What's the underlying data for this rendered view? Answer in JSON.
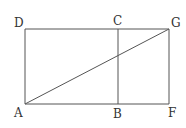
{
  "diagram": {
    "type": "geometry-figure",
    "points": {
      "A": {
        "label": "A",
        "x": 25,
        "y": 104
      },
      "B": {
        "label": "B",
        "x": 118,
        "y": 104
      },
      "F": {
        "label": "F",
        "x": 169,
        "y": 104
      },
      "D": {
        "label": "D",
        "x": 25,
        "y": 29
      },
      "C": {
        "label": "C",
        "x": 118,
        "y": 29
      },
      "G": {
        "label": "G",
        "x": 169,
        "y": 29
      }
    },
    "segments": [
      {
        "name": "DG",
        "from": "D",
        "to": "G"
      },
      {
        "name": "AF",
        "from": "A",
        "to": "F"
      },
      {
        "name": "AD",
        "from": "A",
        "to": "D"
      },
      {
        "name": "FG",
        "from": "F",
        "to": "G"
      },
      {
        "name": "BC",
        "from": "B",
        "to": "C"
      },
      {
        "name": "AG",
        "from": "A",
        "to": "G"
      }
    ],
    "labels": {
      "A": "A",
      "B": "B",
      "C": "C",
      "D": "D",
      "F": "F",
      "G": "G"
    },
    "colors": {
      "line": "#555555",
      "text": "#333333",
      "background": "#ffffff"
    }
  }
}
